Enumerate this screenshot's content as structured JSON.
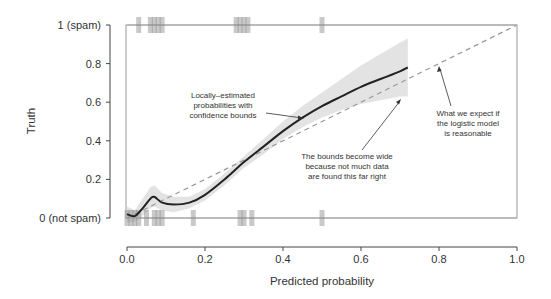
{
  "chart_data": {
    "type": "line",
    "title": "",
    "xlabel": "Predicted probability",
    "ylabel": "Truth",
    "xlim": [
      0,
      1
    ],
    "ylim": [
      0,
      1
    ],
    "x_ticks": [
      0.0,
      0.2,
      0.4,
      0.6,
      0.8,
      1.0
    ],
    "x_tick_labels": [
      "0.0",
      "0.2",
      "0.4",
      "0.6",
      "0.8",
      "1.0"
    ],
    "y_ticks": [
      0,
      0.2,
      0.4,
      0.6,
      0.8,
      1
    ],
    "y_tick_labels": [
      "0 (not spam)",
      "0.2",
      "0.4",
      "0.6",
      "0.8",
      "1 (spam)"
    ],
    "grid": false,
    "series": [
      {
        "name": "Locally-estimated probabilities",
        "style": "solid",
        "color": "#222222",
        "x": [
          0.0,
          0.02,
          0.04,
          0.06,
          0.07,
          0.09,
          0.12,
          0.16,
          0.2,
          0.25,
          0.3,
          0.35,
          0.4,
          0.45,
          0.5,
          0.55,
          0.6,
          0.65,
          0.7,
          0.72
        ],
        "y": [
          0.02,
          0.01,
          0.05,
          0.1,
          0.11,
          0.08,
          0.07,
          0.08,
          0.12,
          0.2,
          0.29,
          0.37,
          0.45,
          0.52,
          0.58,
          0.63,
          0.68,
          0.72,
          0.76,
          0.78
        ]
      },
      {
        "name": "Confidence bound upper",
        "style": "band",
        "color": "#e6e6e6",
        "x": [
          0.0,
          0.02,
          0.04,
          0.06,
          0.07,
          0.09,
          0.12,
          0.16,
          0.2,
          0.25,
          0.3,
          0.35,
          0.4,
          0.45,
          0.5,
          0.55,
          0.6,
          0.65,
          0.7,
          0.72
        ],
        "y": [
          0.06,
          0.04,
          0.1,
          0.16,
          0.17,
          0.13,
          0.11,
          0.11,
          0.15,
          0.23,
          0.32,
          0.41,
          0.5,
          0.58,
          0.65,
          0.72,
          0.79,
          0.85,
          0.91,
          0.93
        ]
      },
      {
        "name": "Confidence bound lower",
        "style": "band",
        "color": "#e6e6e6",
        "x": [
          0.0,
          0.02,
          0.04,
          0.06,
          0.07,
          0.09,
          0.12,
          0.16,
          0.2,
          0.25,
          0.3,
          0.35,
          0.4,
          0.45,
          0.5,
          0.55,
          0.6,
          0.65,
          0.7,
          0.72
        ],
        "y": [
          -0.02,
          -0.02,
          0.01,
          0.05,
          0.06,
          0.04,
          0.03,
          0.05,
          0.09,
          0.17,
          0.26,
          0.33,
          0.41,
          0.47,
          0.52,
          0.56,
          0.59,
          0.61,
          0.63,
          0.63
        ]
      },
      {
        "name": "What we expect if the logistic model is reasonable",
        "style": "dashed",
        "color": "#999999",
        "x": [
          0.0,
          1.0
        ],
        "y": [
          0.0,
          1.0
        ]
      }
    ],
    "rug_truth_0": [
      0.0,
      0.01,
      0.02,
      0.03,
      0.05,
      0.07,
      0.08,
      0.09,
      0.17,
      0.29,
      0.3,
      0.32,
      0.5
    ],
    "rug_truth_1": [
      0.03,
      0.06,
      0.07,
      0.08,
      0.09,
      0.28,
      0.29,
      0.3,
      0.31,
      0.5
    ],
    "annotations": [
      {
        "text": [
          "Locally-estimated",
          "probabilities with",
          "confidence bounds"
        ],
        "arrow_to": [
          0.4,
          0.52
        ]
      },
      {
        "text": [
          "The bounds become wide",
          "because not much data",
          "are found this far right"
        ],
        "arrow_to": [
          0.71,
          0.7
        ]
      },
      {
        "text": [
          "What we expect if",
          "the logistic model",
          "is reasonable"
        ],
        "arrow_to": [
          0.73,
          0.77
        ]
      }
    ]
  },
  "labels": {
    "xlabel": "Predicted probability",
    "ylabel": "Truth",
    "y_tick_1": "1 (spam)",
    "y_tick_08": "0.8",
    "y_tick_06": "0.6",
    "y_tick_04": "0.4",
    "y_tick_02": "0.2",
    "y_tick_0": "0 (not spam)",
    "x_tick_0": "0.0",
    "x_tick_02": "0.2",
    "x_tick_04": "0.4",
    "x_tick_06": "0.6",
    "x_tick_08": "0.8",
    "x_tick_1": "1.0",
    "annot1_l1": "Locally–estimated",
    "annot1_l2": "probabilities with",
    "annot1_l3": "confidence bounds",
    "annot2_l1": "The bounds become wide",
    "annot2_l2": "because not much data",
    "annot2_l3": "are found this far right",
    "annot3_l1": "What we expect if",
    "annot3_l2": "the logistic model",
    "annot3_l3": "is reasonable"
  }
}
